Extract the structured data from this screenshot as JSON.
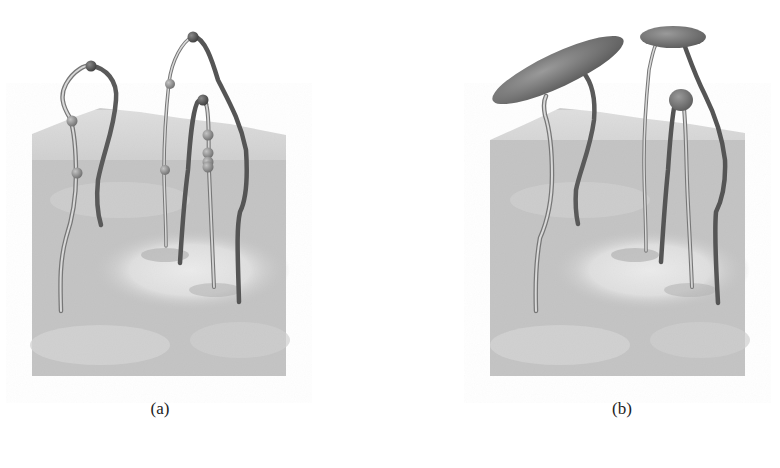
{
  "figure": {
    "panels": [
      {
        "id": "a",
        "caption": "(a)",
        "description": "3D terrain surface with five filament curves rising from it; curves carry small spherical node markers along their length",
        "colors": {
          "terrain_base": "#9a9a9a",
          "terrain_light": "#d8d8d8",
          "curve_dark": "#5a5a5a",
          "curve_light": "#c8c8c8",
          "node": "#8a8a8a",
          "node_dark": "#5e5e5e"
        }
      },
      {
        "id": "b",
        "caption": "(b)",
        "description": "Same terrain and filament curves with the apex nodes replaced by flattened ellipsoid discs and one sphere",
        "colors": {
          "terrain_base": "#9a9a9a",
          "terrain_light": "#d8d8d8",
          "curve_dark": "#5a5a5a",
          "curve_light": "#c8c8c8",
          "disc": "#7c7c7c"
        }
      }
    ]
  }
}
